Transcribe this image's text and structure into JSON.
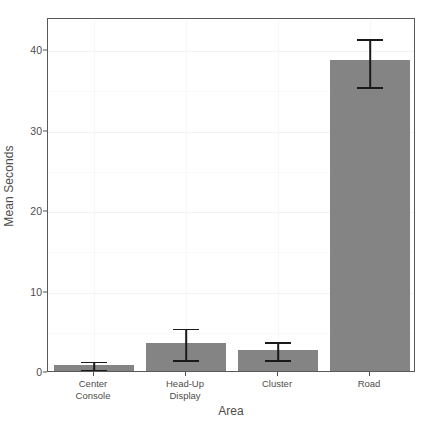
{
  "chart_data": {
    "type": "bar",
    "title": "",
    "xlabel": "Area",
    "ylabel": "Mean Seconds",
    "categories": [
      "Center Console",
      "Head-Up Display",
      "Cluster",
      "Road"
    ],
    "category_lines": [
      [
        "Center",
        "Console"
      ],
      [
        "Head-Up",
        "Display"
      ],
      [
        "Cluster",
        ""
      ],
      [
        "Road",
        ""
      ]
    ],
    "values": [
      0.8,
      3.5,
      2.6,
      38.6
    ],
    "error_low": [
      0.3,
      1.5,
      1.5,
      35.4
    ],
    "error_high": [
      1.3,
      5.4,
      3.7,
      41.4
    ],
    "ylim": [
      0,
      44
    ],
    "yticks": [
      0,
      10,
      20,
      30,
      40
    ],
    "ytick_labels": [
      "0",
      "10",
      "20",
      "30",
      "40"
    ],
    "y_minor_ticks": [
      5,
      15,
      25,
      35
    ],
    "grid": true,
    "legend": "none",
    "bar_color": "#848484",
    "error_color": "#1a1a1a",
    "panel_border_color": "#595959",
    "grid_major_color": "#f3f3f3",
    "grid_minor_color": "#f9f9f9",
    "text_color": "#4d4d4d",
    "background": "#ffffff"
  }
}
